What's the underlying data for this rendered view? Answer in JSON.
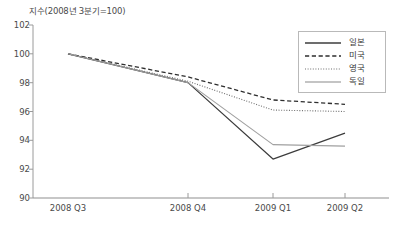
{
  "chart_data": {
    "type": "line",
    "title": "",
    "ylabel": "지수(2008년 3분기=100)",
    "xlabel": "",
    "categories": [
      "2008 Q3",
      "2008 Q4",
      "2009 Q1",
      "2009 Q2"
    ],
    "ylim": [
      90,
      102
    ],
    "yticks": [
      90,
      92,
      94,
      96,
      98,
      100,
      102
    ],
    "xticks": [
      "2008 Q3",
      "2008 Q4",
      "2009 Q1",
      "2009 Q2"
    ],
    "grid": false,
    "legend_position": "top-right",
    "series": [
      {
        "name": "일본",
        "style": "solid",
        "color": "#3c3c3c",
        "width": 1.2,
        "values": [
          100.0,
          98.0,
          92.7,
          94.5
        ]
      },
      {
        "name": "미국",
        "style": "dashed",
        "color": "#2e2e2e",
        "width": 1.3,
        "values": [
          100.0,
          98.4,
          96.8,
          96.5
        ]
      },
      {
        "name": "영국",
        "style": "dotted",
        "color": "#6e6e6e",
        "width": 1.1,
        "values": [
          100.0,
          98.1,
          96.1,
          96.0
        ]
      },
      {
        "name": "독일",
        "style": "solid",
        "color": "#a0a0a0",
        "width": 1.1,
        "values": [
          100.0,
          98.0,
          93.7,
          93.6
        ]
      }
    ]
  },
  "legend": {
    "entries": [
      {
        "label": "일본"
      },
      {
        "label": "미국"
      },
      {
        "label": "영국"
      },
      {
        "label": "독일"
      }
    ]
  },
  "axes": {
    "y_title": "지수(2008년 3분기=100)",
    "y_labels": [
      "102",
      "100",
      "98",
      "96",
      "94",
      "92",
      "90"
    ],
    "x_labels": [
      "2008 Q3",
      "2008 Q4",
      "2009 Q1",
      "2009 Q2"
    ]
  }
}
